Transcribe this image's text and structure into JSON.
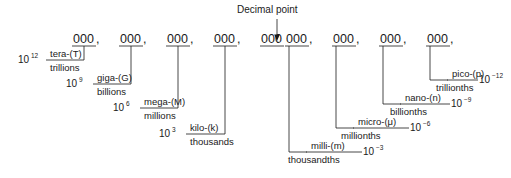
{
  "diagram": {
    "title_note": "Decimal point",
    "digit_group": "000",
    "comma": ",",
    "decimal_point_glyph": ".",
    "groups_left_of_point": 5,
    "groups_right_of_point": 4,
    "prefixes_large": [
      {
        "id": "tera",
        "prefix": "tera-(T)",
        "name": "trillions",
        "power_base": "10",
        "power_exp": "12"
      },
      {
        "id": "giga",
        "prefix": "giga-(G)",
        "name": "billions",
        "power_base": "10",
        "power_exp": "9"
      },
      {
        "id": "mega",
        "prefix": "mega-(M)",
        "name": "millions",
        "power_base": "10",
        "power_exp": "6"
      },
      {
        "id": "kilo",
        "prefix": "kilo-(k)",
        "name": "thousands",
        "power_base": "10",
        "power_exp": "3"
      }
    ],
    "prefixes_small": [
      {
        "id": "milli",
        "prefix": "milli-(m)",
        "name": "thousandths",
        "power_base": "10",
        "power_exp": "−3"
      },
      {
        "id": "micro",
        "prefix": "micro-(μ)",
        "name": "millionths",
        "power_base": "10",
        "power_exp": "−6"
      },
      {
        "id": "nano",
        "prefix": "nano-(n)",
        "name": "billionths",
        "power_base": "10",
        "power_exp": "−9"
      },
      {
        "id": "pico",
        "prefix": "pico-(p)",
        "name": "trillionths",
        "power_base": "10",
        "power_exp": "−12"
      }
    ],
    "colors": {
      "ink": "#1a1a1a",
      "background": "#ffffff"
    }
  }
}
